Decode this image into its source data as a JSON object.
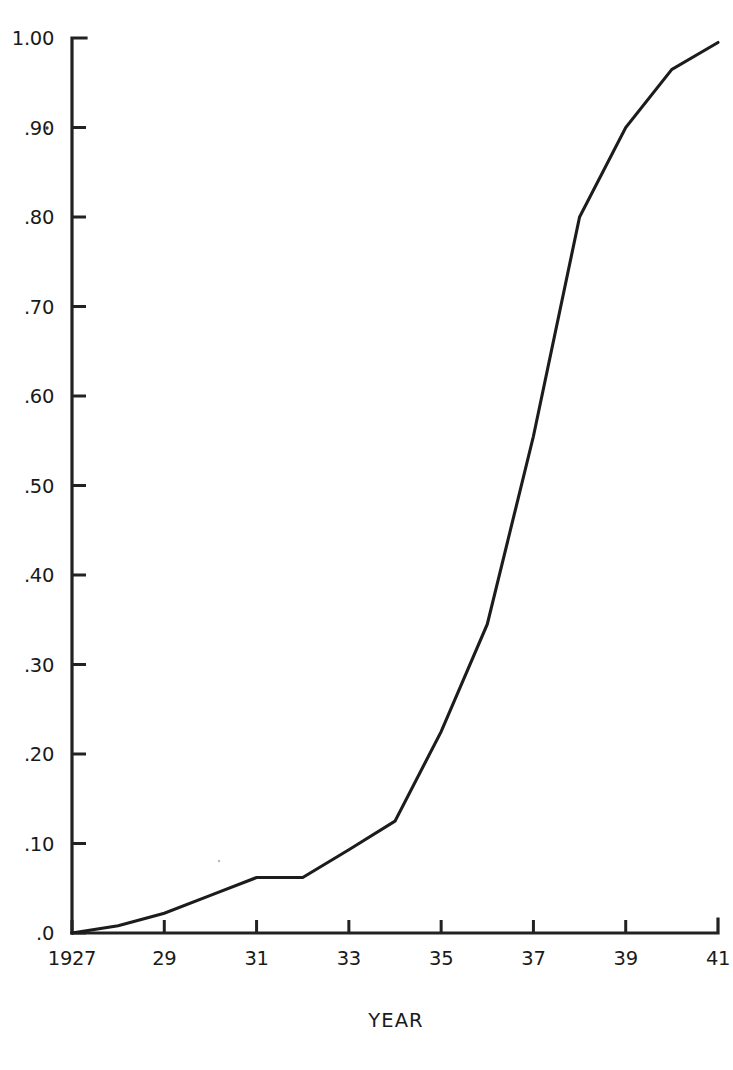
{
  "figure": {
    "background_color": "#ffffff",
    "ink_color": "#1a1a1a",
    "line_color": "#1c1c1c"
  },
  "chart_data": {
    "type": "line",
    "title": "",
    "subtitle": "",
    "xlabel": "YEAR",
    "ylabel": "",
    "xlim": [
      1927,
      1941
    ],
    "ylim": [
      0.0,
      1.0
    ],
    "grid": false,
    "legend": false,
    "legend_position": "none",
    "x_tick_labels": [
      "1927",
      "29",
      "31",
      "33",
      "35",
      "37",
      "39",
      "41"
    ],
    "x_tick_values": [
      1927,
      1929,
      1931,
      1933,
      1935,
      1937,
      1939,
      1941
    ],
    "y_tick_labels": [
      ".0",
      ".10",
      ".20",
      ".30",
      ".40",
      ".50",
      ".60",
      ".70",
      ".80",
      ".90",
      "1.00"
    ],
    "y_tick_values": [
      0.0,
      0.1,
      0.2,
      0.3,
      0.4,
      0.5,
      0.6,
      0.7,
      0.8,
      0.9,
      1.0
    ],
    "x": [
      1927,
      1928,
      1929,
      1930,
      1931,
      1932,
      1933,
      1934,
      1935,
      1936,
      1937,
      1938,
      1939,
      1940,
      1941
    ],
    "values": [
      0.0,
      0.008,
      0.022,
      0.042,
      0.062,
      0.062,
      0.093,
      0.125,
      0.225,
      0.345,
      0.555,
      0.8,
      0.9,
      0.965,
      0.995
    ],
    "series": [
      {
        "name": "cumulative proportion",
        "values": [
          0.0,
          0.008,
          0.022,
          0.042,
          0.062,
          0.062,
          0.093,
          0.125,
          0.225,
          0.345,
          0.555,
          0.8,
          0.9,
          0.965,
          0.995
        ]
      }
    ]
  }
}
